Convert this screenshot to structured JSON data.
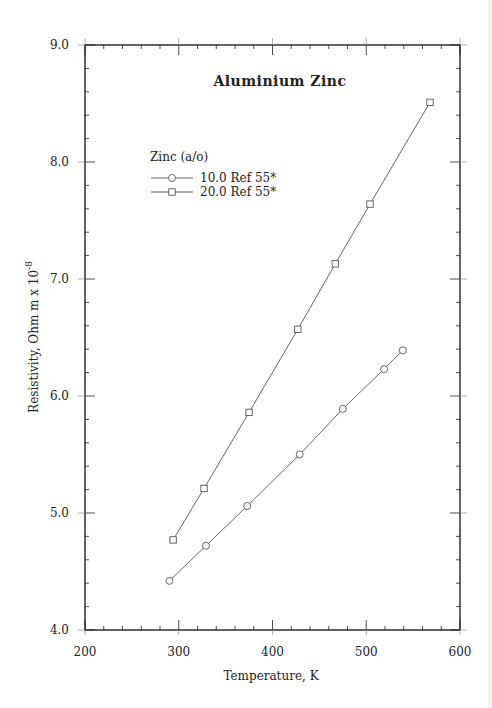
{
  "chart_data": {
    "type": "line",
    "title": "Aluminium  Zinc",
    "xlabel": "Temperature,  K",
    "ylabel": "Resistivity, Ohm m x 10",
    "ylabel_superscript": "-8",
    "xlim": [
      200,
      600
    ],
    "ylim": [
      4.0,
      9.0
    ],
    "x_ticks": [
      200,
      300,
      400,
      500,
      600
    ],
    "x_tick_labels": [
      "200",
      "300",
      "400",
      "500",
      "600"
    ],
    "y_ticks": [
      4.0,
      5.0,
      6.0,
      7.0,
      8.0,
      9.0
    ],
    "y_tick_labels": [
      "4.0",
      "5.0",
      "6.0",
      "7.0",
      "8.0",
      "9.0"
    ],
    "x_minor_step": 20,
    "y_minor_step": 0.2,
    "grid": false,
    "legend": {
      "title": "Zinc (a/o)",
      "position": "upper-left-inside"
    },
    "series": [
      {
        "name": "10.0 Ref 55*",
        "marker": "circle",
        "x": [
          290,
          329,
          373,
          429,
          475,
          519,
          539
        ],
        "y": [
          4.42,
          4.72,
          5.06,
          5.5,
          5.89,
          6.23,
          6.39
        ]
      },
      {
        "name": "20.0 Ref 55*",
        "marker": "square",
        "x": [
          294,
          327,
          375,
          427,
          467,
          504,
          568
        ],
        "y": [
          4.77,
          5.21,
          5.86,
          6.57,
          7.13,
          7.64,
          8.51
        ]
      }
    ]
  },
  "colors": {
    "axis": "#222222",
    "line": "#555555",
    "marker": "#555555",
    "background": "#ffffff"
  }
}
